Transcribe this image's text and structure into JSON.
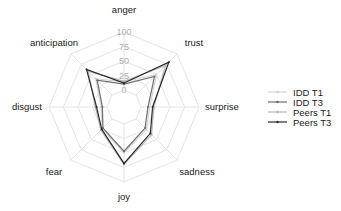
{
  "chart_data": {
    "type": "radar",
    "title": "",
    "categories": [
      "anger",
      "trust",
      "surprise",
      "sadness",
      "joy",
      "fear",
      "disgust",
      "anticipation"
    ],
    "radial_ticks": [
      "0",
      "25",
      "50",
      "75",
      "100"
    ],
    "rlim": [
      0,
      100
    ],
    "grid": true,
    "legend_position": "right",
    "series": [
      {
        "name": "IDD T1",
        "color": "#d4d4d4",
        "values": [
          14,
          50,
          15,
          25,
          50,
          24,
          10,
          40
        ]
      },
      {
        "name": "IDD T3",
        "color": "#6e6e6e",
        "values": [
          10,
          45,
          12,
          22,
          47,
          22,
          8,
          36
        ]
      },
      {
        "name": "Peers T1",
        "color": "#b5b5b5",
        "values": [
          15,
          72,
          22,
          38,
          70,
          27,
          20,
          58
        ]
      },
      {
        "name": "Peers T3",
        "color": "#2a2a2a",
        "values": [
          12,
          80,
          20,
          35,
          68,
          25,
          18,
          62
        ]
      }
    ]
  },
  "legend": {
    "items": [
      "IDD T1",
      "IDD T3",
      "Peers T1",
      "Peers T3"
    ]
  }
}
